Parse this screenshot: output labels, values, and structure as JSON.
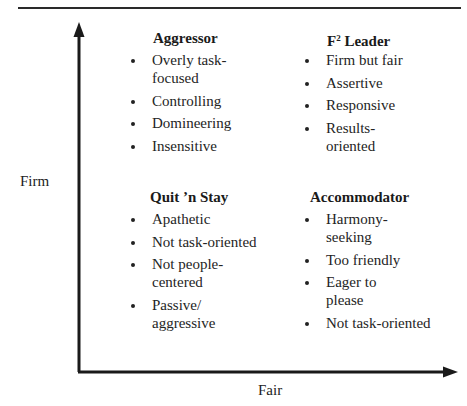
{
  "header": {
    "cut_title": "Gauging Leadership Style"
  },
  "axes": {
    "y_label": "Firm",
    "x_label": "Fair",
    "color": "#1a1a1a"
  },
  "quadrants": {
    "top_left": {
      "title": "Aggressor",
      "items": [
        "Overly task-focused",
        "Controlling",
        "Domineering",
        "Insensitive"
      ]
    },
    "top_right": {
      "title_prefix": "F",
      "title_sup": "2",
      "title_suffix": " Leader",
      "items": [
        "Firm but fair",
        "Assertive",
        "Responsive",
        "Results-oriented"
      ]
    },
    "bottom_left": {
      "title": "Quit ’n Stay",
      "items": [
        "Apathetic",
        "Not task-oriented",
        "Not people-centered",
        "Passive/ aggressive"
      ]
    },
    "bottom_right": {
      "title": "Accommodator",
      "items": [
        "Harmony-seeking",
        "Too friendly",
        "Eager to please",
        "Not task-oriented"
      ]
    }
  }
}
